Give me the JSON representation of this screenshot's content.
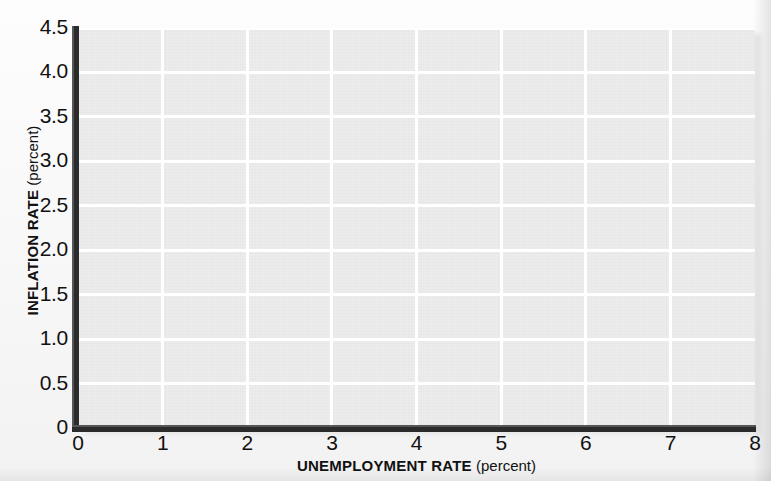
{
  "chart_data": {
    "type": "scatter",
    "title": "",
    "subtitle": "",
    "xlabel_strong": "UNEMPLOYMENT RATE",
    "xlabel_weak": "(percent)",
    "ylabel_strong": "INFLATION RATE",
    "ylabel_weak": "(percent)",
    "xlim": [
      0,
      8
    ],
    "ylim": [
      0,
      4.5
    ],
    "xticks": [
      0,
      1,
      2,
      3,
      4,
      5,
      6,
      7,
      8
    ],
    "xtick_labels": [
      "0",
      "1",
      "2",
      "3",
      "4",
      "5",
      "6",
      "7",
      "8"
    ],
    "yticks": [
      0,
      0.5,
      1.0,
      1.5,
      2.0,
      2.5,
      3.0,
      3.5,
      4.0,
      4.5
    ],
    "ytick_labels": [
      "0",
      "0.5",
      "1.0",
      "1.5",
      "2.0",
      "2.5",
      "3.0",
      "3.5",
      "4.0",
      "4.5"
    ],
    "grid": true,
    "grid_color": "#ffffff",
    "plot_background": "#ecececx",
    "legend": null,
    "legend_position": "none",
    "series": [],
    "values": [],
    "annotations": []
  },
  "figure": {
    "page_background": "#fbfbfb",
    "plot_background": "#ececec",
    "gridline_color": "#ffffff",
    "axis_color": "#2b2b2b",
    "text_color": "#111111"
  }
}
